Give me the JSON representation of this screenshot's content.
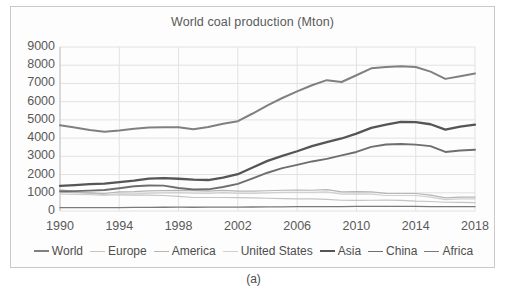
{
  "figure": {
    "caption": "(a)"
  },
  "chart_data": {
    "type": "line",
    "title": "World coal production (Mton)",
    "xlabel": "",
    "ylabel": "",
    "xlim": [
      1990,
      2018
    ],
    "ylim": [
      0,
      9000
    ],
    "grid": true,
    "legend_position": "bottom",
    "y_ticks": [
      9000,
      8000,
      7000,
      6000,
      5000,
      4000,
      3000,
      2000,
      1000,
      0
    ],
    "x_ticks": [
      1990,
      1994,
      1998,
      2002,
      2006,
      2010,
      2014,
      2018
    ],
    "x": [
      1990,
      1991,
      1992,
      1993,
      1994,
      1995,
      1996,
      1997,
      1998,
      1999,
      2000,
      2001,
      2002,
      2003,
      2004,
      2005,
      2006,
      2007,
      2008,
      2009,
      2010,
      2011,
      2012,
      2013,
      2014,
      2015,
      2016,
      2017,
      2018
    ],
    "series": [
      {
        "name": "World",
        "color": "#808080",
        "width": 2.0,
        "values": [
          4700,
          4580,
          4450,
          4350,
          4420,
          4520,
          4580,
          4590,
          4590,
          4490,
          4610,
          4790,
          4930,
          5350,
          5800,
          6200,
          6560,
          6900,
          7180,
          7080,
          7450,
          7830,
          7900,
          7950,
          7900,
          7650,
          7250,
          7400,
          7550
        ]
      },
      {
        "name": "Europe",
        "color": "#c4c4c4",
        "width": 1.2,
        "values": [
          1180,
          1050,
          980,
          900,
          880,
          870,
          870,
          850,
          800,
          740,
          740,
          740,
          730,
          720,
          700,
          680,
          670,
          660,
          640,
          590,
          580,
          590,
          600,
          580,
          540,
          520,
          480,
          470,
          460
        ]
      },
      {
        "name": "America",
        "color": "#b5b5b5",
        "width": 1.2,
        "values": [
          1030,
          1010,
          1000,
          960,
          1050,
          1060,
          1100,
          1120,
          1130,
          1110,
          1090,
          1130,
          1090,
          1090,
          1110,
          1140,
          1150,
          1140,
          1170,
          1050,
          1060,
          1050,
          970,
          960,
          960,
          870,
          720,
          760,
          760
        ]
      },
      {
        "name": "United States",
        "color": "#d0d0d0",
        "width": 1.2,
        "values": [
          930,
          905,
          900,
          855,
          940,
          940,
          980,
          1000,
          1010,
          985,
          970,
          1010,
          970,
          970,
          990,
          1020,
          1030,
          1020,
          1050,
          930,
          940,
          930,
          850,
          850,
          850,
          760,
          620,
          660,
          660
        ]
      },
      {
        "name": "Asia",
        "color": "#555555",
        "width": 2.3,
        "values": [
          1380,
          1420,
          1470,
          1500,
          1580,
          1670,
          1780,
          1800,
          1770,
          1720,
          1700,
          1830,
          2020,
          2390,
          2750,
          3030,
          3280,
          3560,
          3780,
          3980,
          4250,
          4560,
          4740,
          4890,
          4880,
          4760,
          4470,
          4630,
          4740
        ]
      },
      {
        "name": "China",
        "color": "#6e6e6e",
        "width": 1.9,
        "values": [
          1080,
          1090,
          1120,
          1150,
          1250,
          1360,
          1400,
          1390,
          1260,
          1180,
          1190,
          1320,
          1490,
          1790,
          2100,
          2350,
          2530,
          2720,
          2860,
          3050,
          3240,
          3520,
          3650,
          3680,
          3640,
          3560,
          3240,
          3320,
          3360
        ]
      },
      {
        "name": "Africa",
        "color": "#7a7a7a",
        "width": 1.3,
        "values": [
          180,
          180,
          180,
          180,
          190,
          195,
          200,
          205,
          210,
          205,
          210,
          215,
          215,
          220,
          225,
          230,
          235,
          240,
          245,
          245,
          250,
          250,
          250,
          250,
          250,
          245,
          240,
          240,
          240
        ]
      }
    ]
  }
}
